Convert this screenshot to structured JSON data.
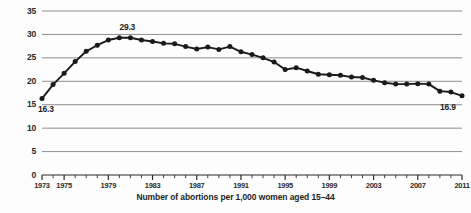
{
  "chart_data": {
    "type": "line",
    "title": "",
    "subtitle": "",
    "caption": "Number of abortions per 1,000 women aged 15–44",
    "xlabel": "",
    "ylabel": "",
    "ylim": [
      0,
      35
    ],
    "xlim": [
      1973,
      2011
    ],
    "grid": true,
    "legend": false,
    "legend_position": "none",
    "marker": "filled-circle",
    "line_color": "#1a1a1a",
    "grid_color": "#8e8e8e",
    "x": [
      1973,
      1974,
      1975,
      1976,
      1977,
      1978,
      1979,
      1980,
      1981,
      1982,
      1983,
      1984,
      1985,
      1986,
      1987,
      1988,
      1989,
      1990,
      1991,
      1992,
      1993,
      1994,
      1995,
      1996,
      1997,
      1998,
      1999,
      2000,
      2001,
      2002,
      2003,
      2004,
      2005,
      2006,
      2007,
      2008,
      2009,
      2010,
      2011
    ],
    "xticklabels": [
      "1973",
      "1975",
      "1979",
      "1983",
      "1987",
      "1991",
      "1995",
      "1999",
      "2003",
      "2007",
      "2011"
    ],
    "xticklabel_values": [
      1973,
      1975,
      1979,
      1983,
      1987,
      1991,
      1995,
      1999,
      2003,
      2007,
      2011
    ],
    "yticks": [
      0,
      5,
      10,
      15,
      20,
      25,
      30,
      35
    ],
    "yticklabels": [
      "0",
      "5",
      "10",
      "15",
      "20",
      "25",
      "30",
      "35"
    ],
    "series": [
      {
        "name": "Abortion rate",
        "values": [
          16.3,
          19.3,
          21.7,
          24.2,
          26.4,
          27.7,
          28.8,
          29.3,
          29.3,
          28.8,
          28.5,
          28.1,
          28.0,
          27.4,
          26.9,
          27.3,
          26.8,
          27.4,
          26.3,
          25.7,
          25.0,
          24.1,
          22.5,
          22.9,
          22.2,
          21.5,
          21.4,
          21.3,
          20.9,
          20.8,
          20.2,
          19.7,
          19.4,
          19.4,
          19.5,
          19.4,
          17.9,
          17.7,
          16.9
        ]
      }
    ],
    "annotations": [
      {
        "name": "peak-value-label",
        "text": "29.3",
        "x": 1981,
        "y": 29.3
      },
      {
        "name": "start-value-label",
        "text": "16.3",
        "x": 1973,
        "y": 16.3
      },
      {
        "name": "end-value-label",
        "text": "16.9",
        "x": 2011,
        "y": 16.9
      }
    ]
  }
}
